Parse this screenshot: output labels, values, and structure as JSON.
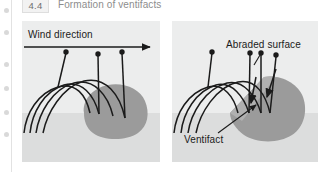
{
  "figure": {
    "number": "4.4",
    "title": "Formation of ventifacts"
  },
  "panels": [
    {
      "id": "before",
      "name": "initial-abrasion-panel",
      "labels": {
        "wind_direction": "Wind direction"
      },
      "annotations": {
        "arrow": "wind-direction-arrow"
      }
    },
    {
      "id": "after",
      "name": "abraded-ventifact-panel",
      "labels": {
        "abraded_surface": "Abraded surface",
        "ventifact": "Ventifact"
      }
    }
  ],
  "colors": {
    "panel_background": "#eceded",
    "ground_band": "#dcdddd",
    "rock_fill": "#9b9b9b",
    "rock_facet": "#b0b0b0",
    "stroke": "#1b1b1b",
    "caption_text": "#8d8d8d",
    "figure_box_background": "#f2f2f2",
    "label_text": "#1b1b1b"
  }
}
